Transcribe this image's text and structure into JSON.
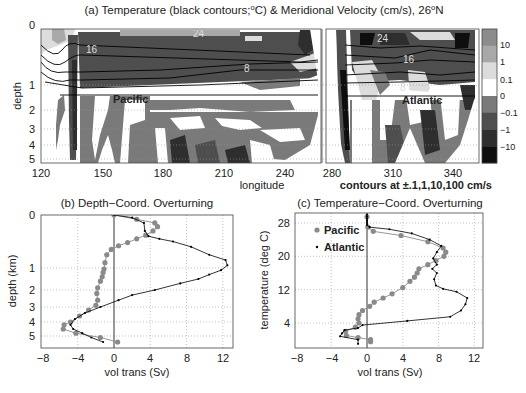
{
  "figure": {
    "panel_a": {
      "title": "(a) Temperature (black contours;°C) & Meridional Velocity (cm/s), 26°N",
      "title_parts": [
        "(a) Temperature (black contours;",
        "o",
        "C) & Meridional Velocity (cm/s), 26",
        "o",
        "N"
      ],
      "ylabel": "depth",
      "xlabel": "longitude",
      "yticks": [
        "0",
        "1",
        "2",
        "3",
        "4",
        "5"
      ],
      "xticks_pacific": [
        "120",
        "150",
        "180",
        "210",
        "240"
      ],
      "xticks_atlantic": [
        "280",
        "310",
        "340"
      ],
      "basin_labels": {
        "pacific": "Pacific",
        "atlantic": "Atlantic"
      },
      "contour_labels_pacific": [
        "16",
        "24",
        "8"
      ],
      "contour_labels_atlantic": [
        "24",
        "16",
        "8"
      ],
      "contour_note": "contours at ±.1,1,10,100 cm/s",
      "colorbar": {
        "labels": [
          "10",
          "1",
          "0.1",
          "0",
          "−0.1",
          "−1",
          "−10"
        ],
        "colors": [
          "#8c8c8c",
          "#a8a8a8",
          "#dcdcdc",
          "#ffffff",
          "#7a7a7a",
          "#4e4e4e",
          "#2e2e2e",
          "#0e0e0e"
        ]
      }
    },
    "panel_b": {
      "title": "(b) Depth−Coord. Overturning",
      "ylabel": "depth (km)",
      "xlabel": "vol trans (Sv)",
      "xticks": [
        "−8",
        "−4",
        "0",
        "4",
        "8",
        "12"
      ],
      "yticks": [
        "0",
        "1",
        "2",
        "3",
        "4",
        "5"
      ]
    },
    "panel_c": {
      "title": "(c) Temperature−Coord. Overturning",
      "ylabel": "temperature (deg C)",
      "xlabel": "vol trans (Sv)",
      "xticks": [
        "−8",
        "−4",
        "0",
        "4",
        "8",
        "12"
      ],
      "yticks": [
        "28",
        "20",
        "12",
        "4"
      ],
      "legend": [
        "Pacific",
        "Atlantic"
      ]
    }
  },
  "chart_data": [
    {
      "type": "heatmap",
      "title": "(a) Temperature (black contours; °C) & Meridional Velocity (cm/s), 26°N",
      "xlabel": "longitude",
      "ylabel": "depth",
      "subpanels": [
        {
          "name": "Pacific",
          "xlim": [
            120,
            250
          ],
          "xticks": [
            120,
            150,
            180,
            210,
            240
          ]
        },
        {
          "name": "Atlantic",
          "xlim": [
            276,
            345
          ],
          "xticks": [
            280,
            310,
            340
          ]
        }
      ],
      "ylim": [
        0,
        5.3
      ],
      "yticks": [
        0,
        1,
        2,
        3,
        4,
        5
      ],
      "temperature_contours_degC": [
        8,
        16,
        24
      ],
      "velocity_contour_levels_cm_s": [
        -100,
        -10,
        -1,
        -0.1,
        0,
        0.1,
        1,
        10,
        100
      ],
      "colorbar_labels": [
        "10",
        "1",
        "0.1",
        "0",
        "-0.1",
        "-1",
        "-10"
      ],
      "annotation": "contours at ±.1,1,10,100 cm/s",
      "grid": true
    },
    {
      "type": "line",
      "title": "(b) Depth-Coord. Overturning",
      "xlabel": "vol trans (Sv)",
      "ylabel": "depth (km)",
      "xlim": [
        -8,
        13
      ],
      "xticks": [
        -8,
        -4,
        0,
        4,
        8,
        12
      ],
      "yticks": [
        0,
        1,
        2,
        3,
        4,
        5
      ],
      "grid": true,
      "series": [
        {
          "name": "Pacific",
          "marker": "gray circle",
          "x": [
            0,
            2.5,
            4.5,
            4.8,
            4.3,
            3.5,
            2.5,
            1.5,
            0.5,
            -0.3,
            -0.8,
            -1.0,
            -1.1,
            -1.2,
            -1.3,
            -1.5,
            -1.8,
            -1.9,
            -1.8,
            -2.0,
            -2.8,
            -3.8,
            -4.8,
            -5.5,
            -5.6,
            -4.2,
            -1.5,
            0.4
          ],
          "y": [
            0,
            0.08,
            0.15,
            0.22,
            0.3,
            0.38,
            0.45,
            0.52,
            0.58,
            0.65,
            0.75,
            0.9,
            1.05,
            1.2,
            1.4,
            1.6,
            1.9,
            2.2,
            2.6,
            2.9,
            3.2,
            3.6,
            4.0,
            4.2,
            4.5,
            4.8,
            5.1,
            5.4
          ]
        },
        {
          "name": "Atlantic",
          "marker": "black dot",
          "x": [
            0,
            2.0,
            3.3,
            3.4,
            3.8,
            5.0,
            6.5,
            8.5,
            10.5,
            12.3,
            12.5,
            11.8,
            10.5,
            9.3,
            7.3,
            4.5,
            2.0,
            0.5,
            -1.5,
            -3.2,
            -4.3,
            -4.8,
            -4.5,
            -3.5,
            -2.5,
            -1.2
          ],
          "y": [
            0,
            0.05,
            0.15,
            0.3,
            0.4,
            0.45,
            0.5,
            0.6,
            0.75,
            0.85,
            0.95,
            1.1,
            1.3,
            1.5,
            1.7,
            2.0,
            2.3,
            2.6,
            3.0,
            3.4,
            3.8,
            4.2,
            4.5,
            4.8,
            5.1,
            5.4
          ]
        }
      ]
    },
    {
      "type": "line",
      "title": "(c) Temperature-Coord. Overturning",
      "xlabel": "vol trans (Sv)",
      "ylabel": "temperature (deg C)",
      "xlim": [
        -8,
        13
      ],
      "ylim": [
        -2,
        30
      ],
      "xticks": [
        -8,
        -4,
        0,
        4,
        8,
        12
      ],
      "yticks": [
        4,
        12,
        20,
        28
      ],
      "grid": true,
      "legend_position": "upper left",
      "series": [
        {
          "name": "Pacific",
          "marker": "gray circle",
          "x": [
            0,
            0.1,
            0.7,
            3.8,
            6.8,
            8.5,
            8.8,
            8.6,
            7.7,
            6.8,
            5.8,
            5.6,
            5.3,
            4.8,
            4.0,
            2.8,
            1.8,
            0.8,
            0.3,
            -0.5,
            -0.9,
            -1.0,
            -0.9,
            -1.3,
            -2.4,
            -2.3,
            -1.0,
            0.4,
            0.4
          ],
          "y": [
            29.5,
            27,
            26,
            25,
            23.5,
            22,
            21,
            20,
            19,
            18,
            17,
            16,
            15,
            14,
            12.5,
            11,
            10,
            9,
            8,
            7,
            6,
            5,
            4,
            3,
            2,
            1,
            0.5,
            0,
            -0.5
          ]
        },
        {
          "name": "Atlantic",
          "marker": "black dot",
          "x": [
            0,
            0,
            0,
            0,
            0,
            0,
            0.3,
            2.5,
            5.0,
            7.0,
            8.3,
            7.8,
            7.4,
            7.8,
            7.3,
            7.8,
            7.5,
            7.7,
            8.5,
            10.0,
            11.2,
            11.0,
            10.5,
            9.3,
            4.5,
            -0.5,
            -1.0,
            -2.5,
            -2.8,
            -3.0,
            -1.0,
            -1.0
          ],
          "y": [
            30,
            29.5,
            29,
            28.5,
            28,
            27.5,
            27,
            26.5,
            25.5,
            24,
            22.5,
            21,
            19.5,
            18,
            17,
            16,
            14.5,
            13,
            12.2,
            11.5,
            10,
            8.5,
            7,
            5.5,
            4.5,
            3.5,
            2.8,
            2.3,
            1.5,
            0.8,
            0,
            -1
          ]
        }
      ]
    }
  ]
}
